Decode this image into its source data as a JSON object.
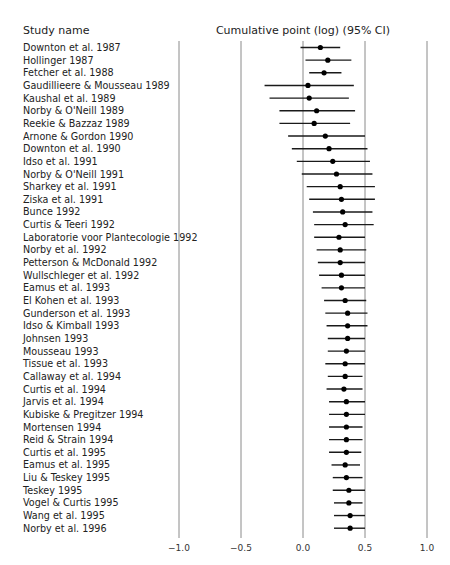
{
  "headers": {
    "study_column": "Study name",
    "plot_column": "Cumulative point (log) (95% CI)"
  },
  "colors": {
    "grid": "#8a8a8a",
    "marker": "#000000",
    "whisker": "#1a1a1a",
    "text": "#222222"
  },
  "chart_data": {
    "type": "forest",
    "title": "Cumulative point (log) (95% CI)",
    "xlabel": "",
    "ylabel": "Study name",
    "xlim": [
      -1.0,
      1.0
    ],
    "xticks": [
      -1.0,
      -0.5,
      0.0,
      0.5,
      1.0
    ],
    "xtick_labels": [
      "−1.0",
      "−0.5",
      "0.0",
      "0.5",
      "1.0"
    ],
    "grid": "vertical lines at ticks",
    "studies": [
      {
        "name": "Downton et al. 1987",
        "point": 0.14,
        "lower": -0.02,
        "upper": 0.3
      },
      {
        "name": "Hollinger 1987",
        "point": 0.2,
        "lower": 0.02,
        "upper": 0.39
      },
      {
        "name": "Fetcher et al. 1988",
        "point": 0.17,
        "lower": 0.05,
        "upper": 0.31
      },
      {
        "name": "Gaudillieere & Mousseau 1989",
        "point": 0.04,
        "lower": -0.31,
        "upper": 0.41
      },
      {
        "name": "Kaushal et al. 1989",
        "point": 0.05,
        "lower": -0.27,
        "upper": 0.37
      },
      {
        "name": "Norby & O'Neill 1989",
        "point": 0.11,
        "lower": -0.19,
        "upper": 0.42
      },
      {
        "name": "Reekie & Bazzaz 1989",
        "point": 0.09,
        "lower": -0.19,
        "upper": 0.38
      },
      {
        "name": "Arnone & Gordon 1990",
        "point": 0.18,
        "lower": -0.12,
        "upper": 0.5
      },
      {
        "name": "Downton et al. 1990",
        "point": 0.21,
        "lower": -0.09,
        "upper": 0.52
      },
      {
        "name": "Idso et al. 1991",
        "point": 0.24,
        "lower": -0.05,
        "upper": 0.54
      },
      {
        "name": "Norby & O'Neill 1991",
        "point": 0.27,
        "lower": -0.01,
        "upper": 0.56
      },
      {
        "name": "Sharkey et al. 1991",
        "point": 0.3,
        "lower": 0.03,
        "upper": 0.58
      },
      {
        "name": "Ziska et al. 1991",
        "point": 0.31,
        "lower": 0.05,
        "upper": 0.58
      },
      {
        "name": "Bunce 1992",
        "point": 0.32,
        "lower": 0.08,
        "upper": 0.56
      },
      {
        "name": "Curtis & Teeri 1992",
        "point": 0.34,
        "lower": 0.09,
        "upper": 0.57
      },
      {
        "name": "Laboratorie voor Plantecologie 1992",
        "point": 0.29,
        "lower": 0.09,
        "upper": 0.5
      },
      {
        "name": "Norby et al. 1992",
        "point": 0.3,
        "lower": 0.11,
        "upper": 0.51
      },
      {
        "name": "Petterson & McDonald 1992",
        "point": 0.3,
        "lower": 0.12,
        "upper": 0.5
      },
      {
        "name": "Wullschleger et al. 1992",
        "point": 0.31,
        "lower": 0.13,
        "upper": 0.5
      },
      {
        "name": "Eamus et al. 1993",
        "point": 0.31,
        "lower": 0.15,
        "upper": 0.5
      },
      {
        "name": "El Kohen et al. 1993",
        "point": 0.34,
        "lower": 0.17,
        "upper": 0.51
      },
      {
        "name": "Gunderson et al. 1993",
        "point": 0.36,
        "lower": 0.18,
        "upper": 0.52
      },
      {
        "name": "Idso & Kimball 1993",
        "point": 0.36,
        "lower": 0.19,
        "upper": 0.52
      },
      {
        "name": "Johnsen 1993",
        "point": 0.36,
        "lower": 0.2,
        "upper": 0.5
      },
      {
        "name": "Mousseau 1993",
        "point": 0.35,
        "lower": 0.2,
        "upper": 0.5
      },
      {
        "name": "Tissue et al. 1993",
        "point": 0.34,
        "lower": 0.18,
        "upper": 0.5
      },
      {
        "name": "Callaway et al. 1994",
        "point": 0.34,
        "lower": 0.2,
        "upper": 0.48
      },
      {
        "name": "Curtis et al. 1994",
        "point": 0.33,
        "lower": 0.19,
        "upper": 0.48
      },
      {
        "name": "Jarvis et al. 1994",
        "point": 0.35,
        "lower": 0.21,
        "upper": 0.5
      },
      {
        "name": "Kubiske & Pregitzer 1994",
        "point": 0.35,
        "lower": 0.21,
        "upper": 0.5
      },
      {
        "name": "Mortensen 1994",
        "point": 0.35,
        "lower": 0.21,
        "upper": 0.48
      },
      {
        "name": "Reid & Strain 1994",
        "point": 0.35,
        "lower": 0.21,
        "upper": 0.48
      },
      {
        "name": "Curtis et al. 1995",
        "point": 0.35,
        "lower": 0.21,
        "upper": 0.47
      },
      {
        "name": "Eamus et al. 1995",
        "point": 0.34,
        "lower": 0.23,
        "upper": 0.46
      },
      {
        "name": "Liu & Teskey 1995",
        "point": 0.35,
        "lower": 0.24,
        "upper": 0.48
      },
      {
        "name": "Teskey 1995",
        "point": 0.37,
        "lower": 0.24,
        "upper": 0.5
      },
      {
        "name": "Vogel & Curtis 1995",
        "point": 0.37,
        "lower": 0.25,
        "upper": 0.48
      },
      {
        "name": "Wang et al. 1995",
        "point": 0.38,
        "lower": 0.25,
        "upper": 0.5
      },
      {
        "name": "Norby et al. 1996",
        "point": 0.38,
        "lower": 0.25,
        "upper": 0.5
      }
    ]
  }
}
